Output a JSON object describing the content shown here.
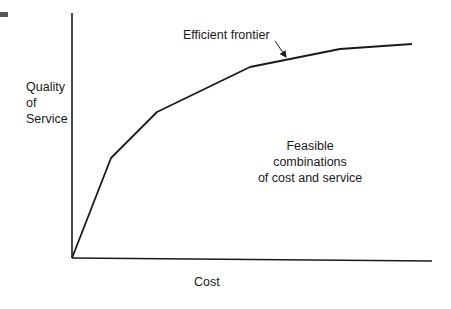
{
  "chart_data": {
    "type": "line",
    "title": "",
    "xlabel": "Cost",
    "ylabel": "Quality of Service",
    "ylabel_lines": [
      "Quality",
      "of",
      "Service"
    ],
    "grid": false,
    "legend": null,
    "series": [
      {
        "name": "Efficient frontier",
        "points_px": [
          [
            72,
            258
          ],
          [
            111,
            158
          ],
          [
            157,
            112
          ],
          [
            250,
            67
          ],
          [
            340,
            49
          ],
          [
            412,
            44
          ]
        ],
        "x_rel": [
          0,
          0.11,
          0.24,
          0.5,
          0.75,
          0.95
        ],
        "y_rel": [
          0,
          0.41,
          0.6,
          0.78,
          0.85,
          0.87
        ]
      }
    ],
    "annotations": [
      {
        "text": "Efficient frontier",
        "arrow_to": [
          286,
          57
        ]
      },
      {
        "text": "Feasible combinations of cost and service",
        "lines": [
          "Feasible",
          "combinations",
          "of cost and service"
        ]
      }
    ],
    "axes": {
      "x_ticks": [],
      "y_ticks": []
    }
  },
  "labels": {
    "y_axis": [
      "Quality",
      "of",
      "Service"
    ],
    "x_axis": "Cost",
    "frontier": "Efficient frontier",
    "region": [
      "Feasible",
      "combinations",
      "of cost and service"
    ]
  },
  "colors": {
    "line": "#1a1a1a",
    "background": "#ffffff"
  }
}
